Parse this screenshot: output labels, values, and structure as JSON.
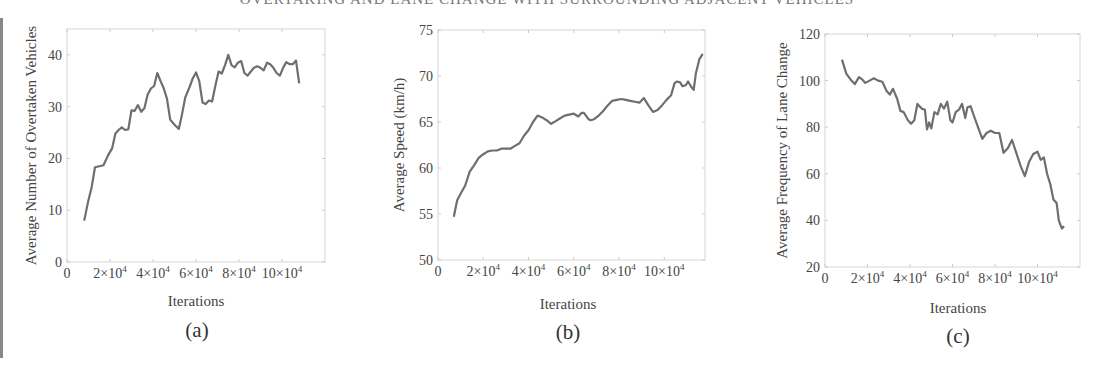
{
  "page": {
    "top_title_partial": "OVERTAKING AND LANE CHANGE WITH SURROUNDING ADJACENT VEHICLES"
  },
  "chart_data": [
    {
      "id": "a",
      "type": "line",
      "caption": "(a)",
      "title": "",
      "xlabel": "Iterations",
      "ylabel": "Average Number of Overtaken Vehicles",
      "xlim": [
        0,
        120000
      ],
      "ylim": [
        0,
        45
      ],
      "grid": false,
      "yticks": [
        0,
        10,
        20,
        30,
        40
      ],
      "xticks": [
        0,
        20000,
        40000,
        60000,
        80000,
        100000
      ],
      "xtick_labels": [
        "0",
        "2×10^4",
        "4×10^4",
        "6×10^4",
        "8×10^4",
        "10×10^4"
      ],
      "line_color": "#6e6e6e",
      "x": [
        8000,
        10000,
        11500,
        13000,
        15000,
        17000,
        19000,
        21000,
        22500,
        24000,
        25500,
        27000,
        28500,
        30000,
        31500,
        33000,
        34500,
        36000,
        37500,
        39000,
        40500,
        42000,
        43500,
        45000,
        46500,
        48000,
        50000,
        52000,
        53500,
        55000,
        57000,
        58500,
        60000,
        61500,
        63000,
        64500,
        66000,
        67500,
        69000,
        70500,
        72000,
        73500,
        75000,
        76500,
        78000,
        79500,
        81000,
        82500,
        84000,
        85500,
        87000,
        88500,
        90000,
        91500,
        93000,
        94500,
        96000,
        97500,
        99000,
        100500,
        102000,
        103500,
        105000,
        106500,
        108000,
        109500,
        111000,
        112500
      ],
      "values": [
        8,
        12,
        14.5,
        18.3,
        18.5,
        18.7,
        20.5,
        22,
        24.8,
        25.5,
        26,
        25.5,
        25.6,
        29.3,
        29.2,
        30.3,
        29,
        29.7,
        32.3,
        33.5,
        34,
        36.5,
        35,
        33.5,
        31.5,
        27.5,
        26.5,
        25.7,
        28.5,
        31.8,
        33.8,
        35.5,
        36.6,
        35,
        30.8,
        30.5,
        31.2,
        31,
        34,
        36.8,
        36.4,
        38,
        40,
        38,
        37.6,
        38.5,
        38.8,
        36.5,
        36,
        36.8,
        37.5,
        37.8,
        37.5,
        37,
        38.5,
        38.2,
        37.5,
        36.5,
        36,
        37.5,
        38.6,
        38.2,
        38.2,
        38.9,
        34.5
      ],
      "plot_px": {
        "left": 67,
        "right": 325,
        "top": 29,
        "bottom": 262
      }
    },
    {
      "id": "b",
      "type": "line",
      "caption": "(b)",
      "title": "",
      "xlabel": "Iterations",
      "ylabel": "Average Speed (km/h)",
      "xlim": [
        0,
        118000
      ],
      "ylim": [
        50,
        75
      ],
      "grid": false,
      "yticks": [
        50,
        55,
        60,
        65,
        70,
        75
      ],
      "xticks": [
        0,
        20000,
        40000,
        60000,
        80000,
        100000
      ],
      "xtick_labels": [
        "0",
        "2×10^4",
        "4×10^4",
        "6×10^4",
        "8×10^4",
        "10×10^4"
      ],
      "line_color": "#6e6e6e",
      "x": [
        7000,
        8500,
        10000,
        12000,
        14000,
        16000,
        18000,
        20000,
        22000,
        24000,
        26000,
        28000,
        30000,
        32000,
        34000,
        36000,
        38000,
        40000,
        42000,
        44000,
        46000,
        48000,
        50000,
        52000,
        54000,
        56000,
        58000,
        60000,
        62000,
        63500,
        64500,
        66500,
        67500,
        69000,
        71000,
        73000,
        75000,
        77000,
        79000,
        81000,
        83000,
        85000,
        87000,
        89000,
        91000,
        93000,
        95000,
        97000,
        99000,
        101000,
        103000,
        104500,
        105500,
        107000,
        108000,
        109500,
        110500,
        112000,
        113000,
        114000,
        115500,
        117000
      ],
      "values": [
        54.7,
        56.5,
        57.2,
        58.1,
        59.6,
        60.3,
        61.1,
        61.5,
        61.8,
        61.9,
        61.9,
        62.1,
        62.1,
        62.1,
        62.4,
        62.7,
        63.5,
        64.1,
        65.0,
        65.7,
        65.5,
        65.2,
        64.8,
        65.1,
        65.4,
        65.7,
        65.8,
        65.9,
        65.6,
        66.0,
        66.0,
        65.3,
        65.2,
        65.3,
        65.7,
        66.2,
        66.8,
        67.3,
        67.4,
        67.5,
        67.4,
        67.3,
        67.2,
        67.1,
        67.6,
        66.8,
        66.1,
        66.3,
        66.8,
        67.4,
        67.9,
        69.2,
        69.4,
        69.3,
        68.9,
        69.0,
        69.4,
        68.8,
        68.5,
        70.3,
        71.8,
        72.4
      ],
      "plot_px": {
        "left": 438,
        "right": 705,
        "top": 30,
        "bottom": 260
      }
    },
    {
      "id": "c",
      "type": "line",
      "caption": "(c)",
      "title": "",
      "xlabel": "Iterations",
      "ylabel": "Average Frequency of Lane Change",
      "xlim": [
        0,
        120000
      ],
      "ylim": [
        20,
        120
      ],
      "grid": false,
      "yticks": [
        20,
        40,
        60,
        80,
        100,
        120
      ],
      "xticks": [
        0,
        20000,
        40000,
        60000,
        80000,
        100000
      ],
      "xtick_labels": [
        "0",
        "2×10^4",
        "4×10^4",
        "6×10^4",
        "8×10^4",
        "10×10^4"
      ],
      "line_color": "#6e6e6e",
      "x": [
        8000,
        10000,
        12000,
        14000,
        16000,
        17500,
        19000,
        21000,
        23000,
        25000,
        27000,
        29000,
        30500,
        32000,
        34000,
        35500,
        37000,
        39000,
        40500,
        42000,
        43500,
        45500,
        47000,
        48000,
        49000,
        50000,
        51500,
        53000,
        54500,
        56000,
        57500,
        59000,
        60000,
        61500,
        63000,
        64500,
        66000,
        67000,
        68500,
        70000,
        72000,
        74000,
        76000,
        78000,
        80000,
        82000,
        84000,
        86000,
        88000,
        90000,
        92000,
        94000,
        96000,
        98000,
        100000,
        101500,
        103000,
        104500,
        106000,
        107500,
        109000,
        110000,
        111500,
        112500
      ],
      "values": [
        109,
        103,
        100.5,
        98.5,
        101.5,
        100.5,
        99,
        100,
        101,
        100,
        99.5,
        95.5,
        94,
        96.5,
        92,
        87,
        86.5,
        83,
        81.5,
        83,
        90,
        88,
        87.5,
        79,
        82,
        79.5,
        86.5,
        85.5,
        90,
        88,
        91,
        83,
        82,
        86.5,
        87.5,
        90,
        84,
        88.5,
        89,
        85,
        80,
        75,
        77.5,
        78.5,
        77.5,
        77.5,
        69,
        71,
        74.5,
        69,
        63.5,
        59,
        65,
        68.5,
        69.5,
        66,
        67,
        60,
        55.5,
        49,
        47.5,
        40,
        36.5,
        37.5
      ],
      "plot_px": {
        "left": 825,
        "right": 1080,
        "top": 34,
        "bottom": 267
      }
    }
  ]
}
